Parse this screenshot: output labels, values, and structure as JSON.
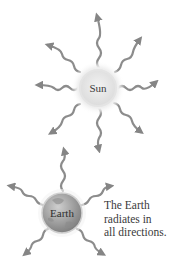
{
  "diagram": {
    "sun": {
      "label": "Sun",
      "cx": 98,
      "cy": 88,
      "r": 17
    },
    "earth": {
      "label": "Earth",
      "cx": 62,
      "cy": 213,
      "r": 20
    },
    "caption": {
      "lines": [
        "The Earth",
        "radiates in",
        "all directions."
      ]
    },
    "colors": {
      "arrow": "#8a8a8a",
      "sun_fill": "#e6e6e6",
      "sun_glow": "#f2f2f2",
      "earth_fill": "#9a9a9a",
      "text": "#333333"
    }
  }
}
